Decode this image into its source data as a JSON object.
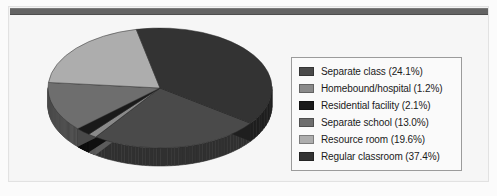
{
  "figure": {
    "background_color": "#f4f4f4",
    "rule_color": "#646464",
    "frame_color": "#e2e2e2"
  },
  "legend": {
    "border_color": "#9b9b9b",
    "background_color": "#fafafa",
    "items": [
      {
        "label": "Separate class (24.1%)",
        "color": "#4a4a4a"
      },
      {
        "label": "Homebound/hospital (1.2%)",
        "color": "#8a8a8a"
      },
      {
        "label": "Residential facility (2.1%)",
        "color": "#1a1a1a"
      },
      {
        "label": "Separate school (13.0%)",
        "color": "#6e6e6e"
      },
      {
        "label": "Resource room (19.6%)",
        "color": "#adadad"
      },
      {
        "label": "Regular classroom (37.4%)",
        "color": "#333333"
      }
    ]
  },
  "chart_data": {
    "type": "pie",
    "title": "",
    "xlabel": "",
    "ylabel": "",
    "legend_position": "right",
    "three_d": true,
    "categories": [
      "Separate class",
      "Homebound/hospital",
      "Residential facility",
      "Separate school",
      "Resource room",
      "Regular classroom"
    ],
    "values": [
      24.1,
      1.2,
      2.1,
      13.0,
      19.6,
      37.4
    ],
    "units": "percent",
    "labels": [
      "Separate class (24.1%)",
      "Homebound/hospital (1.2%)",
      "Residential facility (2.1%)",
      "Separate school (13.0%)",
      "Resource room (19.6%)",
      "Regular classroom (37.4%)"
    ],
    "colors": [
      "#4a4a4a",
      "#8a8a8a",
      "#1a1a1a",
      "#6e6e6e",
      "#adadad",
      "#333333"
    ],
    "side_colors": [
      "#303030",
      "#5c5c5c",
      "#101010",
      "#494949",
      "#767676",
      "#1f1f1f"
    ],
    "geometry": {
      "center_x": 134,
      "center_y": 72,
      "radius_x": 112,
      "radius_y": 60,
      "depth": 18,
      "start_angle_deg": 36
    }
  }
}
